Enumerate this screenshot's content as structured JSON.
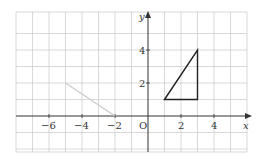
{
  "diagram": {
    "type": "coordinate-grid",
    "x_axis_label": "x",
    "y_axis_label": "y",
    "origin_label": "O",
    "x_range": [
      -8,
      6
    ],
    "y_range": [
      -2,
      6
    ],
    "x_tick_labels": [
      "−6",
      "−4",
      "−2",
      "2",
      "4"
    ],
    "y_tick_labels": [
      "2",
      "4"
    ],
    "shapes": [
      {
        "name": "triangle",
        "vertices": [
          [
            1,
            1
          ],
          [
            3,
            4
          ],
          [
            3,
            1
          ]
        ],
        "color": "#222222"
      },
      {
        "name": "gray-line",
        "points": [
          [
            -5,
            2
          ],
          [
            -2,
            0
          ]
        ],
        "color": "#cccccc"
      }
    ],
    "colors": {
      "grid": "#c8c8c8",
      "axis": "#333333",
      "triangle": "#222222",
      "gray_line": "#cccccc"
    }
  }
}
